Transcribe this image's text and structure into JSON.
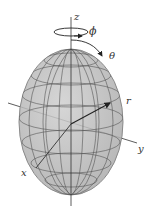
{
  "diagram": {
    "type": "spherical-coordinates-ellipsoid",
    "labels": {
      "z": "z",
      "phi": "ϕ",
      "theta": "θ",
      "r": "r",
      "y": "y",
      "x": "x"
    },
    "colors": {
      "surface": "#b9b9b9",
      "surface_edge": "#8a8a8a",
      "grid": "#555555",
      "axis": "#333333"
    }
  }
}
